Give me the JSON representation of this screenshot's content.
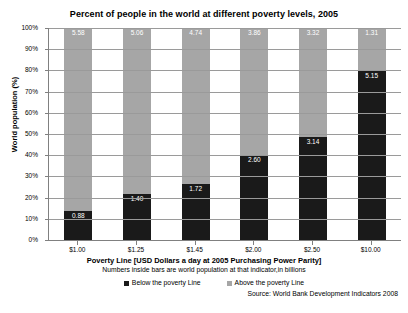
{
  "chart_data": {
    "type": "bar",
    "subtype": "stacked-100-percent",
    "title": "Percent of people in the world at different poverty levels, 2005",
    "xlabel": "Poverty Line [USD Dollars a day at 2005 Purchasing Power Parity]",
    "xlabel_note": "Numbers inside bars are world population at that indicator,in billions",
    "ylabel": "World population (%)",
    "ylim": [
      0,
      100
    ],
    "ytick_labels": [
      "100%",
      "90%",
      "80%",
      "70%",
      "60%",
      "50%",
      "40%",
      "30%",
      "20%",
      "10%",
      "0%"
    ],
    "ytick_values": [
      100,
      90,
      80,
      70,
      60,
      50,
      40,
      30,
      20,
      10,
      0
    ],
    "grid": true,
    "legend_position": "bottom",
    "categories": [
      "$1.00",
      "$1.25",
      "$1.45",
      "$2.00",
      "$2.50",
      "$10.00"
    ],
    "series": [
      {
        "name": "Below the poverty Line",
        "color": "#1a1a1a",
        "values": [
          0.88,
          1.4,
          1.72,
          2.6,
          3.14,
          5.15
        ],
        "percent": [
          13.6,
          21.7,
          26.6,
          40.2,
          48.6,
          79.7
        ]
      },
      {
        "name": "Above the poverty Line",
        "color": "#a6a6a6",
        "values": [
          5.58,
          5.06,
          4.74,
          3.86,
          3.32,
          1.31
        ],
        "percent": [
          86.4,
          78.3,
          73.4,
          59.8,
          51.4,
          20.3
        ]
      }
    ],
    "source": "Source: World Bank Development Indicators 2008"
  },
  "legend": {
    "items": [
      {
        "label": "Below the poverty Line",
        "key": "below"
      },
      {
        "label": "Above the poverty Line",
        "key": "above"
      }
    ]
  },
  "colors": {
    "below_poverty": "#1a1a1a",
    "above_poverty": "#a6a6a6",
    "gridline": "#9a9a9a",
    "axis": "#808080",
    "background": "#ffffff"
  }
}
